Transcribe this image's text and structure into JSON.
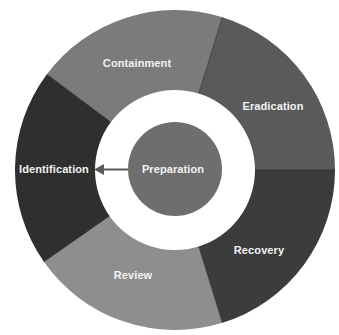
{
  "diagram": {
    "center": {
      "label": "Preparation",
      "color": "#6e6e6e"
    },
    "segments": [
      {
        "label": "Recovery",
        "color": "#3c3c3c"
      },
      {
        "label": "Review",
        "color": "#8e8e8e"
      },
      {
        "label": "Identification",
        "color": "#2f2f2f"
      },
      {
        "label": "Containment",
        "color": "#7b7b7b"
      },
      {
        "label": "Eradication",
        "color": "#5a5a5a"
      }
    ],
    "arrow": {
      "from": "Preparation",
      "to": "Identification",
      "color": "#5a5a5a"
    }
  }
}
